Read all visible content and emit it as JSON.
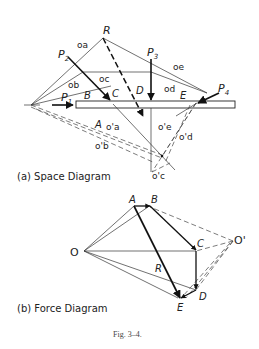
{
  "space_diagram": {
    "caption": "(a) Space Diagram",
    "forces": [
      "P",
      "P",
      "P",
      "P"
    ],
    "force_subscripts": [
      "1",
      "2",
      "3",
      "4"
    ],
    "resultant": "R",
    "spaces": [
      "A",
      "B",
      "C",
      "D",
      "E"
    ],
    "rays": [
      "oa",
      "ob",
      "oc",
      "od",
      "oe"
    ],
    "rays_prime": [
      "o'a",
      "o'b",
      "o'c",
      "o'd",
      "o'e"
    ]
  },
  "force_diagram": {
    "caption": "(b) Force Diagram",
    "pole": "O",
    "pole_prime": "O'",
    "points": [
      "A",
      "B",
      "C",
      "D",
      "E"
    ],
    "resultant": "R"
  },
  "figure_caption": "Fig. 3–4."
}
